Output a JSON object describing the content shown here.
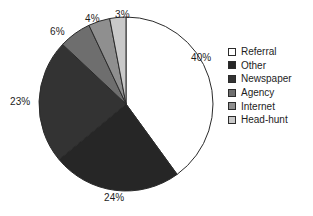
{
  "chart_data": {
    "type": "pie",
    "title": "",
    "subtitle": "",
    "xlabel": "",
    "ylabel": "",
    "grid": false,
    "legend_position": "right",
    "start_angle_deg": 0,
    "direction": "clockwise",
    "categories": [
      "Referral",
      "Other",
      "Newspaper",
      "Agency",
      "Internet",
      "Head-hunt"
    ],
    "values": [
      40,
      24,
      23,
      6,
      4,
      3
    ],
    "value_unit": "%",
    "data_labels": [
      "40%",
      "24%",
      "23%",
      "6%",
      "4%",
      "3%"
    ],
    "slice_colors": [
      "#ffffff",
      "#262626",
      "#333333",
      "#6e6e6e",
      "#8f8f8f",
      "#c9c9c9"
    ],
    "slice_outline_color": "#2b2b2b"
  },
  "legend": {
    "items": [
      {
        "label": "Referral",
        "color": "#ffffff"
      },
      {
        "label": "Other",
        "color": "#262626"
      },
      {
        "label": "Newspaper",
        "color": "#333333"
      },
      {
        "label": "Agency",
        "color": "#6e6e6e"
      },
      {
        "label": "Internet",
        "color": "#8f8f8f"
      },
      {
        "label": "Head-hunt",
        "color": "#c9c9c9"
      }
    ]
  },
  "labels": {
    "referral_pct": "40%",
    "other_pct": "24%",
    "newspaper_pct": "23%",
    "agency_pct": "6%",
    "internet_pct": "4%",
    "headhunt_pct": "3%"
  }
}
